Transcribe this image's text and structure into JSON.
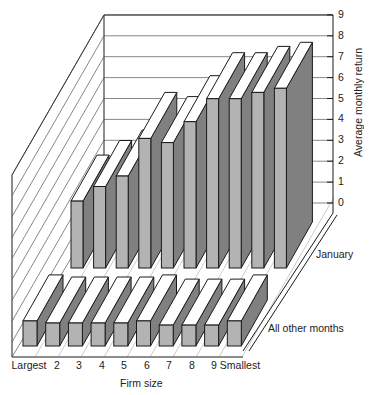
{
  "chart_data": {
    "type": "bar",
    "subtype": "3d-grouped-rows",
    "title": "",
    "xlabel": "Firm size",
    "ylabel": "Average monthly return",
    "categories": [
      "Largest",
      "2",
      "3",
      "4",
      "5",
      "6",
      "7",
      "8",
      "9",
      "Smallest"
    ],
    "series": [
      {
        "name": "January",
        "values": [
          3.2,
          3.9,
          4.4,
          6.2,
          6.0,
          7.0,
          8.1,
          8.1,
          8.4,
          8.6
        ]
      },
      {
        "name": "All other months",
        "values": [
          1.2,
          1.1,
          1.1,
          1.1,
          1.1,
          1.2,
          1.0,
          1.0,
          1.0,
          1.2
        ]
      }
    ],
    "yticks": [
      "0",
      "1",
      "2",
      "3",
      "4",
      "5",
      "6",
      "7",
      "8",
      "9"
    ],
    "ylim": [
      0,
      9
    ],
    "grid": true,
    "legend": "row labels at right",
    "colors": {
      "front_face": "#b3b3b3",
      "side_face": "#808080",
      "top_face": "#ffffff",
      "outline": "#1a1a1a",
      "grid": "#555555"
    }
  }
}
